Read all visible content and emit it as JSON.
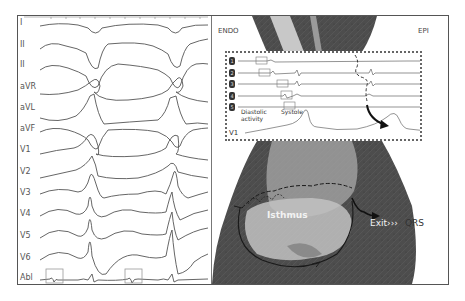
{
  "figure": {
    "ecg_panel": {
      "leads": [
        {
          "label": "I",
          "y": 6
        },
        {
          "label": "II",
          "y": 28
        },
        {
          "label": "II",
          "y": 48
        },
        {
          "label": "aVR",
          "y": 70
        },
        {
          "label": "aVL",
          "y": 91
        },
        {
          "label": "aVF",
          "y": 112
        },
        {
          "label": "V1",
          "y": 133
        },
        {
          "label": "V2",
          "y": 155
        },
        {
          "label": "V3",
          "y": 176
        },
        {
          "label": "V4",
          "y": 197
        },
        {
          "label": "V5",
          "y": 219
        },
        {
          "label": "V6",
          "y": 241
        },
        {
          "label": "Abl",
          "y": 261
        }
      ],
      "abl_boxes": 2
    },
    "histology_panel": {
      "endo_label": "ENDO",
      "epi_label": "EPI",
      "inset": {
        "channels": [
          "1",
          "2",
          "3",
          "4",
          "5"
        ],
        "diastolic_label": "Diastolic\nactivity",
        "diastolic_line1": "Diastolic",
        "diastolic_line2": "activity",
        "systole_label": "Systole",
        "v1_label": "V1"
      },
      "isthmus_label": "Isthmus",
      "exit_label": "Exit›››",
      "qrs_label": "QRS"
    },
    "colors": {
      "trace": "#555555",
      "tissue_dark": "#4a4a4a",
      "tissue_light": "#bdbdbd",
      "frame": "#555555"
    }
  }
}
